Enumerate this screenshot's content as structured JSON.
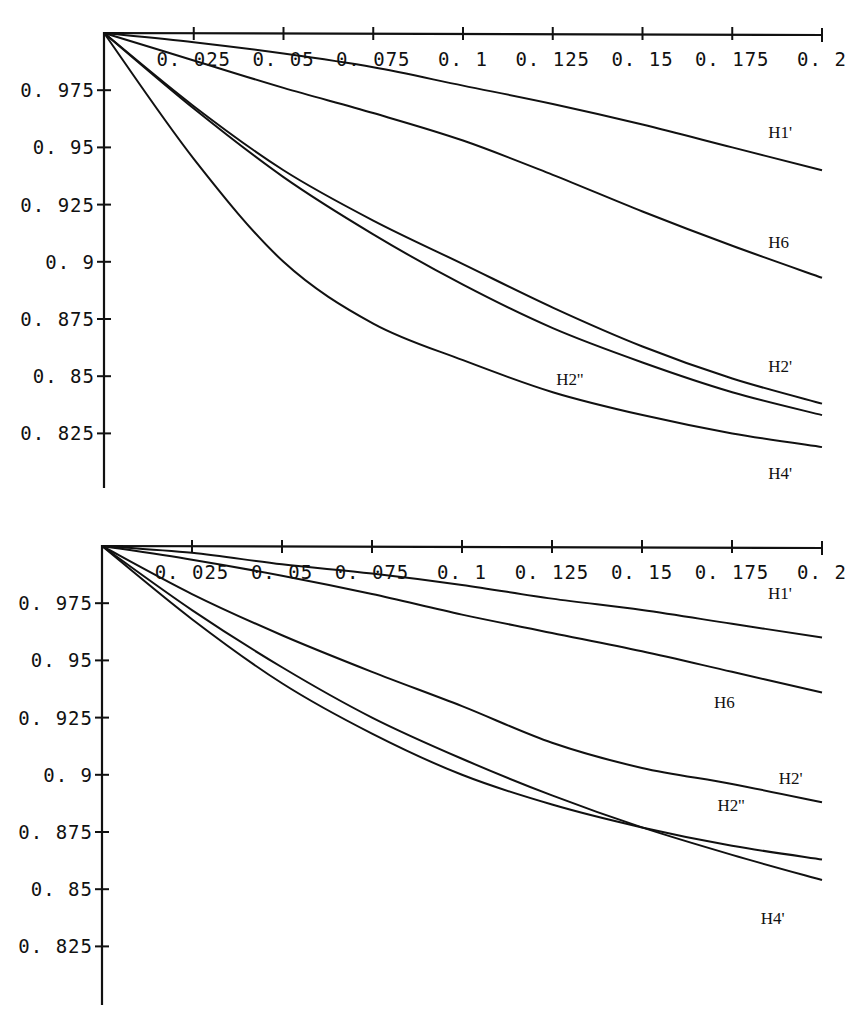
{
  "chart_data": [
    {
      "type": "line",
      "title": "",
      "xlabel": "",
      "ylabel": "",
      "xlim": [
        0,
        0.2
      ],
      "ylim": [
        0.8,
        1.0
      ],
      "grid": false,
      "legend": "inline labels at right end of curves",
      "x_ticks": [
        "0.025",
        "0.05",
        "0.075",
        "0.1",
        "0.125",
        "0.15",
        "0.175",
        "0.2"
      ],
      "y_ticks": [
        "0.975",
        "0.95",
        "0.925",
        "0.9",
        "0.875",
        "0.85",
        "0.825"
      ],
      "x": [
        0,
        0.025,
        0.05,
        0.075,
        0.1,
        0.125,
        0.15,
        0.175,
        0.2
      ],
      "series": [
        {
          "name": "H1'",
          "values": [
            1.0,
            0.996,
            0.991,
            0.985,
            0.977,
            0.969,
            0.96,
            0.95,
            0.94
          ]
        },
        {
          "name": "H6",
          "values": [
            1.0,
            0.988,
            0.976,
            0.965,
            0.953,
            0.938,
            0.922,
            0.907,
            0.893
          ]
        },
        {
          "name": "H2'",
          "values": [
            1.0,
            0.968,
            0.94,
            0.918,
            0.899,
            0.88,
            0.863,
            0.849,
            0.838
          ]
        },
        {
          "name": "H2''",
          "values": [
            1.0,
            0.967,
            0.937,
            0.912,
            0.89,
            0.871,
            0.856,
            0.843,
            0.833
          ]
        },
        {
          "name": "H4'",
          "values": [
            1.0,
            0.945,
            0.9,
            0.873,
            0.857,
            0.843,
            0.833,
            0.825,
            0.819
          ]
        }
      ],
      "labels": [
        {
          "text": "H1'",
          "x": 0.185,
          "y": 0.954
        },
        {
          "text": "H6",
          "x": 0.185,
          "y": 0.906
        },
        {
          "text": "H2'",
          "x": 0.185,
          "y": 0.852
        },
        {
          "text": "H2''",
          "x": 0.126,
          "y": 0.846
        },
        {
          "text": "H4'",
          "x": 0.185,
          "y": 0.805
        }
      ]
    },
    {
      "type": "line",
      "title": "",
      "xlabel": "",
      "ylabel": "",
      "xlim": [
        0,
        0.2
      ],
      "ylim": [
        0.8,
        1.0
      ],
      "grid": false,
      "legend": "inline labels at right end of curves",
      "x_ticks": [
        "0.025",
        "0.05",
        "0.075",
        "0.1",
        "0.125",
        "0.15",
        "0.175",
        "0.2"
      ],
      "y_ticks": [
        "0.975",
        "0.95",
        "0.925",
        "0.9",
        "0.875",
        "0.85",
        "0.825"
      ],
      "x": [
        0,
        0.025,
        0.05,
        0.075,
        0.1,
        0.125,
        0.15,
        0.175,
        0.2
      ],
      "series": [
        {
          "name": "H1'",
          "values": [
            1.0,
            0.997,
            0.992,
            0.988,
            0.983,
            0.977,
            0.972,
            0.966,
            0.96
          ]
        },
        {
          "name": "H6",
          "values": [
            1.0,
            0.994,
            0.987,
            0.979,
            0.97,
            0.962,
            0.954,
            0.945,
            0.936
          ]
        },
        {
          "name": "H2'",
          "values": [
            1.0,
            0.979,
            0.961,
            0.945,
            0.93,
            0.914,
            0.903,
            0.896,
            0.888
          ]
        },
        {
          "name": "H2''",
          "values": [
            1.0,
            0.968,
            0.94,
            0.918,
            0.9,
            0.887,
            0.877,
            0.869,
            0.863
          ]
        },
        {
          "name": "H4'",
          "values": [
            1.0,
            0.972,
            0.947,
            0.925,
            0.907,
            0.891,
            0.877,
            0.865,
            0.854
          ]
        }
      ],
      "labels": [
        {
          "text": "H1'",
          "x": 0.185,
          "y": 0.977
        },
        {
          "text": "H6",
          "x": 0.17,
          "y": 0.929
        },
        {
          "text": "H2'",
          "x": 0.188,
          "y": 0.896
        },
        {
          "text": "H2''",
          "x": 0.171,
          "y": 0.884
        },
        {
          "text": "H4'",
          "x": 0.183,
          "y": 0.835
        }
      ]
    }
  ]
}
